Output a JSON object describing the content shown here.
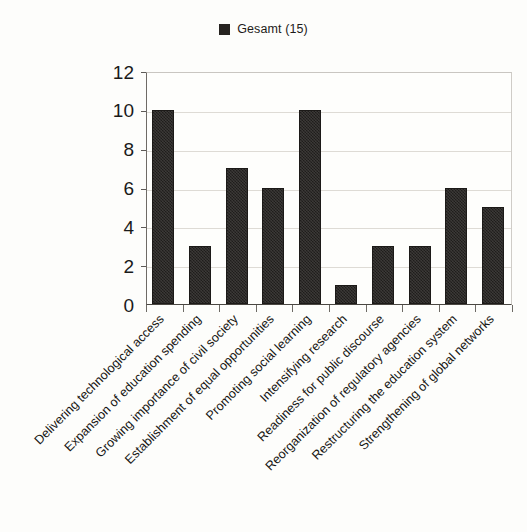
{
  "legend": {
    "entries": [
      {
        "label": "Gesamt (15)",
        "color": "#262320",
        "marker": "filled-square"
      }
    ],
    "position": "top-center"
  },
  "axes": {
    "y": {
      "ticks": [
        "0",
        "2",
        "4",
        "6",
        "8",
        "10",
        "12"
      ],
      "min": 0,
      "max": 12,
      "label": ""
    },
    "x": {
      "label": "",
      "tick_count": 10
    }
  },
  "chart_data": {
    "type": "bar",
    "title": "",
    "subtitle": "",
    "xlabel": "",
    "ylabel": "",
    "ylim": [
      0,
      12
    ],
    "ytick_values": [
      0,
      2,
      4,
      6,
      8,
      10,
      12
    ],
    "grid": true,
    "legend_position": "top-center",
    "categories": [
      "Delivering technological access",
      "Expansion of education spending",
      "Growing importance of civil society",
      "Establishment of equal opportunities",
      "Promoting social learning",
      "Intensifying research",
      "Readiness for public discourse",
      "Reorganization of regulatory agencies",
      "Restructuring the education system",
      "Strengthening of global networks"
    ],
    "series": [
      {
        "name": "Gesamt (15)",
        "color": "#2a2724",
        "values": [
          10,
          3,
          7,
          6,
          10,
          1,
          3,
          3,
          6,
          5
        ]
      }
    ]
  }
}
